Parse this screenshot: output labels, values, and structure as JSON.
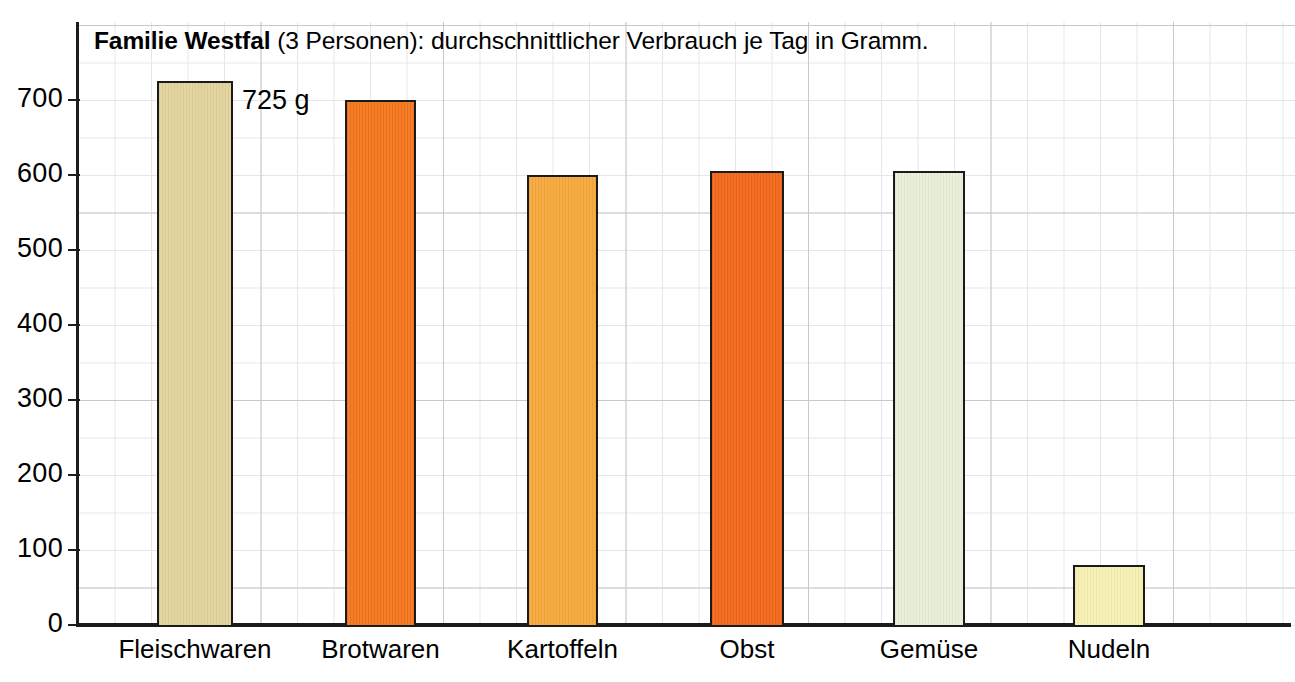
{
  "chart_data": {
    "type": "bar",
    "title": "Familie Westfal (3 Personen): durchschnittlicher Verbrauch je Tag in Gramm.",
    "title_bold_part": "Familie Westfal",
    "title_rest_part": " (3 Personen): durchschnittlicher Verbrauch je Tag in Gramm.",
    "categories": [
      "Fleischwaren",
      "Brotwaren",
      "Kartoffeln",
      "Obst",
      "Gemüse",
      "Nudeln"
    ],
    "values": [
      725,
      700,
      600,
      605,
      605,
      80
    ],
    "xlabel": "",
    "ylabel": "",
    "ylim": [
      0,
      740
    ],
    "yticks": [
      0,
      100,
      200,
      300,
      400,
      500,
      600,
      700
    ],
    "ytick_labels": [
      "0",
      "100",
      "200",
      "300",
      "400",
      "500",
      "600",
      "700"
    ],
    "grid": true,
    "legend": "none",
    "unit": "Gramm",
    "annotations": [
      {
        "text": "725 g",
        "category": "Fleischwaren",
        "value": 725
      }
    ],
    "bar_colors": [
      "#e2d49b",
      "#f4761c",
      "#f6a93c",
      "#f2671a",
      "#e9f0d9",
      "#f7f0b4"
    ],
    "bar_border_color": "#1a1a1a",
    "grid_color": "#c9c9c9",
    "grid_minor_color": "#e6e6e6",
    "axis_color": "#1c1c1c",
    "background_color": "#ffffff"
  }
}
